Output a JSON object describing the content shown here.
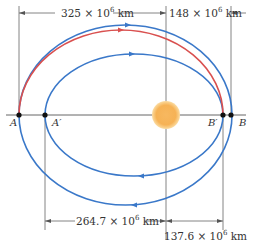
{
  "diagram": {
    "type": "orbital transfer ellipses",
    "labels": {
      "top_left_distance": "325 × 10",
      "top_left_exp": "6",
      "top_left_unit": " km",
      "top_right_distance": "148 × 10",
      "top_right_exp": "6",
      "top_right_unit": " km",
      "bottom_left_distance": "264.7 × 10",
      "bottom_left_exp": "6",
      "bottom_left_unit": " km",
      "bottom_right_distance": "137.6 × 10",
      "bottom_right_exp": "6",
      "bottom_right_unit": " km"
    },
    "points": {
      "A": "A",
      "A_prime": "A′",
      "B_prime": "B′",
      "B": "B"
    },
    "colors": {
      "orbit": "#3a78c9",
      "transfer": "#d9504f",
      "sun_core": "#f6b255",
      "sun_edge": "#f9d89a",
      "lines": "#555555"
    }
  }
}
